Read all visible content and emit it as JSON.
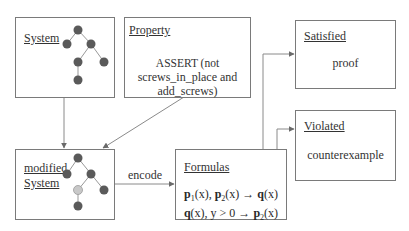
{
  "boxes": {
    "system": {
      "title": "System"
    },
    "property": {
      "title": "Property",
      "lines": [
        "ASSERT (not",
        "screws_in_place and",
        "add_screws)"
      ]
    },
    "satisfied": {
      "title": "Satisfied",
      "body": "proof"
    },
    "violated": {
      "title": "Violated",
      "body": "counterexample"
    },
    "modified_system": {
      "title_line1": "modified",
      "title_line2": "System"
    },
    "formulas": {
      "title": "Formulas",
      "line1": {
        "p1": "p",
        "p1_sub": "1",
        "p1_arg": "(x), ",
        "p2": "p",
        "p2_sub": "2",
        "p2_arg": "(x) → ",
        "q": "q",
        "q_arg": "(x)"
      },
      "line2": {
        "q": "q",
        "q_arg": "(x), y > 0 → ",
        "p2": "p",
        "p2_sub": "2",
        "p2_arg": "(x)"
      }
    }
  },
  "edges": {
    "encode_label": "encode"
  },
  "colors": {
    "node_dark": "#5a5a5a",
    "node_light": "#c8c8c8",
    "line": "#8a8a8a",
    "border": "#7a7a7a"
  }
}
